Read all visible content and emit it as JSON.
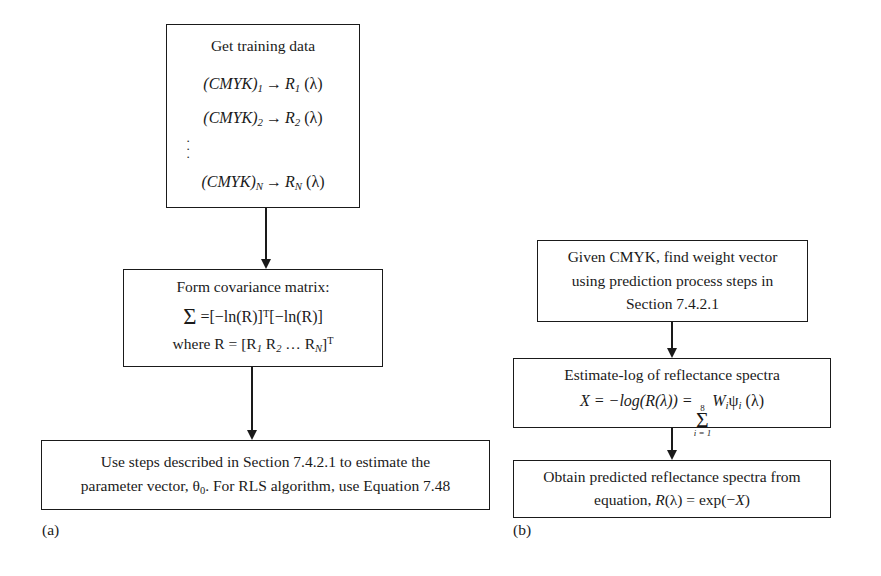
{
  "figure": {
    "panels": [
      {
        "id": "a",
        "label": "(a)"
      },
      {
        "id": "b",
        "label": "(b)"
      }
    ]
  },
  "panel_a": {
    "box_training": {
      "title": "Get training data",
      "rows": [
        {
          "cmyk": "(CMYK)",
          "cmyk_sub": "1",
          "arrow": "→",
          "r": "R",
          "r_sub": "1",
          "lambda": "(λ)"
        },
        {
          "cmyk": "(CMYK)",
          "cmyk_sub": "2",
          "arrow": "→",
          "r": "R",
          "r_sub": "2",
          "lambda": "(λ)"
        },
        {
          "cmyk": "(CMYK)",
          "cmyk_sub": "N",
          "arrow": "→",
          "r": "R",
          "r_sub": "N",
          "lambda": "(λ)"
        }
      ],
      "vertical_dots": "·"
    },
    "box_covariance": {
      "title": "Form covariance matrix:",
      "equation_sigma": "Σ",
      "equation_body": "=[−ln(R)]",
      "equation_sup1": "T",
      "equation_body2": "[−ln(R)]",
      "equation_where": "where R = [R",
      "where_sub1": "1",
      "where_mid": " R",
      "where_sub2": "2",
      "where_dots": " …  R",
      "where_sub3": "N",
      "where_close": "]",
      "where_sup": "T"
    },
    "box_steps": {
      "line1": "Use steps described in Section 7.4.2.1 to estimate the",
      "line2_pre": "parameter vector, θ",
      "line2_sub": "0",
      "line2_post": ". For RLS algorithm, use Equation 7.48"
    }
  },
  "panel_b": {
    "box_given": {
      "line1": "Given CMYK, find weight vector",
      "line2": "using prediction process steps in",
      "line3": "Section 7.4.2.1"
    },
    "box_estimate": {
      "title": "Estimate-log of reflectance spectra",
      "eq_lhs": "X = −log(R(λ)) =",
      "sum_top": "8",
      "sum_symbol": "Σ",
      "sum_bottom": "i = 1",
      "eq_w": "W",
      "eq_w_sub": "i",
      "eq_psi": "ψ",
      "eq_psi_sub": "i",
      "eq_lambda": "(λ)"
    },
    "box_obtain": {
      "line1": "Obtain predicted reflectance spectra from",
      "line2_pre": "equation, ",
      "line2_r": "R",
      "line2_rest": "(λ) = exp(−",
      "line2_x": "X",
      "line2_close": ")"
    }
  }
}
